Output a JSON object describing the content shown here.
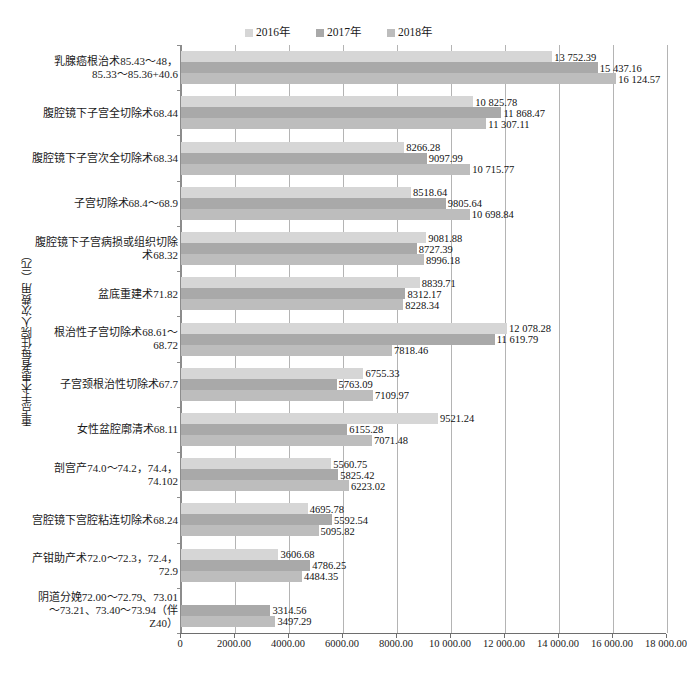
{
  "chart_data": {
    "type": "bar",
    "orientation": "horizontal",
    "title": "",
    "xlabel": "",
    "ylabel": "重点手术患者每住院人次费用（元）",
    "xlim": [
      0,
      18000
    ],
    "xticks": [
      "0",
      "2000.00",
      "4000.00",
      "6000.00",
      "8000.00",
      "10 000.00",
      "12 000.00",
      "14 000.00",
      "16 000.00",
      "18 000.00"
    ],
    "xtick_values": [
      0,
      2000,
      4000,
      6000,
      8000,
      10000,
      12000,
      14000,
      16000,
      18000
    ],
    "grid": true,
    "legend_position": "top-center",
    "categories": [
      "乳腺癌根治术85.43～48，85.33～85.36+40.6",
      "腹腔镜下子宫全切除术68.44",
      "腹腔镜下子宫次全切除术68.34",
      "子宫切除术68.4～68.9",
      "腹腔镜下子宫病损或组织切除术68.32",
      "盆底重建术71.82",
      "根治性子宫切除术68.61～68.72",
      "子宫颈根治性切除术67.7",
      "女性盆腔廓清术68.11",
      "剖宫产74.0～74.2，74.4，74.102",
      "宫腔镜下宫腔粘连切除术68.24",
      "产钳助产术72.0～72.3，72.4，72.9",
      "阴道分娩72.00～72.79、73.01～73.21、73.40～73.94（伴Z40）"
    ],
    "series": [
      {
        "name": "2016年",
        "color": "#d6d6d6",
        "values": [
          13752.39,
          10825.78,
          8266.28,
          8518.64,
          9081.88,
          8839.71,
          12078.28,
          6755.33,
          9521.24,
          5560.75,
          4695.78,
          3606.68,
          null
        ],
        "labels": [
          "13 752.39",
          "10 825.78",
          "8266.28",
          "8518.64",
          "9081.88",
          "8839.71",
          "12 078.28",
          "6755.33",
          "9521.24",
          "5560.75",
          "4695.78",
          "3606.68",
          null
        ]
      },
      {
        "name": "2017年",
        "color": "#a9a9a9",
        "values": [
          15437.16,
          11868.47,
          9097.99,
          9805.64,
          8727.39,
          8312.17,
          11619.79,
          5763.09,
          6155.28,
          5825.42,
          5592.54,
          4786.25,
          3314.56
        ],
        "labels": [
          "15 437.16",
          "11 868.47",
          "9097.99",
          "9805.64",
          "8727.39",
          "8312.17",
          "11 619.79",
          "5763.09",
          "6155.28",
          "5825.42",
          "5592.54",
          "4786.25",
          "3314.56"
        ]
      },
      {
        "name": "2018年",
        "color": "#bdbdbd",
        "values": [
          16124.57,
          11307.11,
          10715.77,
          10698.84,
          8996.18,
          8228.34,
          7818.46,
          7109.97,
          7071.48,
          6223.02,
          5095.82,
          4484.35,
          3497.29
        ],
        "labels": [
          "16 124.57",
          "11 307.11",
          "10 715.77",
          "10 698.84",
          "8996.18",
          "8228.34",
          "7818.46",
          "7109.97",
          "7071.48",
          "6223.02",
          "5095.82",
          "4484.35",
          "3497.29"
        ]
      }
    ]
  }
}
